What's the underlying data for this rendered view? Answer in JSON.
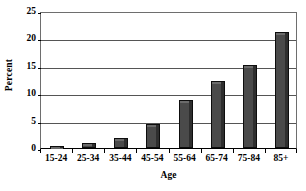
{
  "chart_data": {
    "type": "bar",
    "title": "",
    "subtitle": "",
    "xlabel": "Age",
    "ylabel": "Percent",
    "categories": [
      "15-24",
      "25-34",
      "35-44",
      "45-54",
      "55-64",
      "65-74",
      "75-84",
      "85+"
    ],
    "values": [
      0.4,
      0.9,
      1.8,
      4.4,
      8.7,
      12.2,
      15.2,
      21.1
    ],
    "ylim": [
      0,
      25
    ],
    "ytick_labels": [
      "0",
      "5",
      "10",
      "15",
      "20",
      "25"
    ],
    "ytick_values": [
      0,
      5,
      10,
      15,
      20,
      25
    ],
    "grid": "horizontal",
    "legend": "none",
    "series": [
      {
        "name": "Percent",
        "values": [
          0.4,
          0.9,
          1.8,
          4.4,
          8.7,
          12.2,
          15.2,
          21.1
        ]
      }
    ],
    "colors": {
      "bar_fill": "#4a4a4a",
      "bar_outline": "#0d0d0d",
      "bar_highlight": "#6b6b6b",
      "gridline": "#555555",
      "frame": "#6e6e6e",
      "axis": "#000000",
      "background": "#ffffff",
      "text": "#000000"
    }
  }
}
